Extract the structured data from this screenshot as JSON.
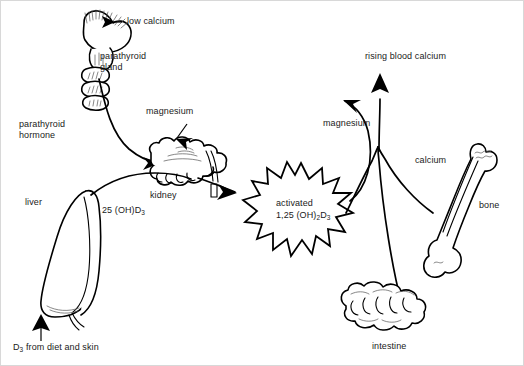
{
  "figure": {
    "background_color": "#ffffff",
    "line_color": "#000000",
    "text_color": "#1a1a1a",
    "width": 524,
    "height": 366
  },
  "labels": {
    "low_calcium": "low calcium",
    "parathyroid_gland": "parathyroid\ngland",
    "parathyroid_hormone": "parathyroid\nhormone",
    "magnesium_left": "magnesium",
    "magnesium_right": "magnesium",
    "kidney": "kidney",
    "liver": "liver",
    "hydroxy_d3": "25 (OH)D",
    "hydroxy_d3_sub": "3",
    "d3_source": "D",
    "d3_source_sub": "3",
    "d3_source_rest": " from diet and skin",
    "activated_line1": "activated",
    "activated_line2_a": "1,25 (OH)",
    "activated_line2_sub1": "2",
    "activated_line2_b": "D",
    "activated_line2_sub2": "3",
    "rising_blood_calcium": "rising blood calcium",
    "calcium": "calcium",
    "bone": "bone",
    "intestine": "intestine"
  },
  "organs": [
    {
      "name": "parathyroid-gland",
      "label": "parathyroid gland"
    },
    {
      "name": "kidney",
      "label": "kidney"
    },
    {
      "name": "liver",
      "label": "liver"
    },
    {
      "name": "bone",
      "label": "bone"
    },
    {
      "name": "intestine",
      "label": "intestine"
    }
  ],
  "flows": [
    {
      "from": "low calcium",
      "to": "parathyroid gland"
    },
    {
      "from": "parathyroid gland",
      "to": "kidney",
      "label": "parathyroid hormone"
    },
    {
      "from": "magnesium",
      "to": "kidney"
    },
    {
      "from": "liver",
      "to": "kidney",
      "label": "25 (OH)D3"
    },
    {
      "from": "D3 from diet and skin",
      "to": "liver"
    },
    {
      "from": "kidney",
      "to": "activated 1,25 (OH)2D3"
    },
    {
      "from": "activated 1,25 (OH)2D3",
      "to": "magnesium"
    },
    {
      "from": "bone",
      "to": "rising blood calcium",
      "label": "calcium"
    },
    {
      "from": "intestine",
      "to": "rising blood calcium"
    }
  ]
}
